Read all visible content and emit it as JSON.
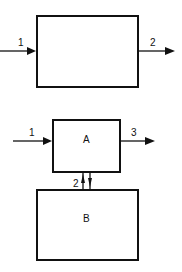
{
  "diagram": {
    "top": {
      "box": {
        "label": ""
      },
      "input": {
        "label": "1"
      },
      "output": {
        "label": "2"
      }
    },
    "bottom": {
      "box_a": {
        "label": "A"
      },
      "box_b": {
        "label": "B"
      },
      "input": {
        "label": "1"
      },
      "output": {
        "label": "3"
      },
      "exchange": {
        "label": "2"
      }
    }
  }
}
